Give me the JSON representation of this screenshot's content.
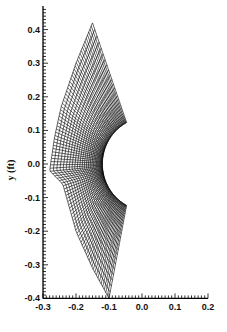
{
  "chart_data": {
    "type": "line",
    "title": "",
    "xlabel": "",
    "ylabel": "y (ft)",
    "xlim": [
      -0.3,
      0.2
    ],
    "ylim": [
      -0.4,
      0.47
    ],
    "x_ticks": [
      -0.3,
      -0.2,
      -0.1,
      0.0,
      0.1,
      0.2
    ],
    "x_tick_labels": [
      "-0.3",
      "-0.2",
      "-0.1",
      "0.0",
      "0.1",
      "0.2"
    ],
    "y_ticks": [
      0.4,
      0.3,
      0.2,
      0.1,
      0.0,
      -0.1,
      -0.2,
      -0.3,
      -0.4
    ],
    "y_tick_labels": [
      "0.4",
      "0.3",
      "0.2",
      "0.1",
      "0.0",
      "-0.1",
      "-0.2",
      "-0.3",
      "-0.4"
    ],
    "grid": false,
    "legend": null,
    "mesh": {
      "inner_boundary": {
        "shape": "circular arc",
        "center": [
          0.02,
          0.0
        ],
        "radius": 0.14,
        "start": [
          -0.045,
          0.12
        ],
        "end": [
          -0.045,
          -0.12
        ]
      },
      "outer_boundary_points": [
        [
          -0.15,
          0.42
        ],
        [
          -0.2,
          0.3
        ],
        [
          -0.245,
          0.17
        ],
        [
          -0.265,
          0.08
        ],
        [
          -0.28,
          -0.02
        ],
        [
          -0.24,
          -0.06
        ],
        [
          -0.2,
          -0.2
        ],
        [
          -0.15,
          -0.31
        ],
        [
          -0.1,
          -0.4
        ]
      ],
      "side_edges": [
        {
          "from": [
            -0.045,
            0.12
          ],
          "to": [
            -0.15,
            0.42
          ]
        },
        {
          "from": [
            -0.045,
            -0.12
          ],
          "to": [
            -0.1,
            -0.4
          ]
        }
      ],
      "radial_lines": 90,
      "circumferential_lines": 28
    },
    "line_color": "#000000"
  }
}
